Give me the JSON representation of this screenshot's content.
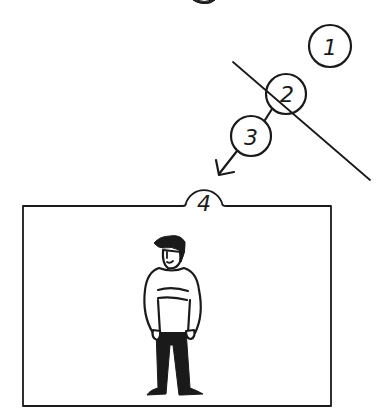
{
  "diagram": {
    "title_fragment": "g",
    "steps": [
      {
        "id": 1,
        "label": "1"
      },
      {
        "id": 2,
        "label": "2"
      },
      {
        "id": 3,
        "label": "3"
      },
      {
        "id": 4,
        "label": "4"
      }
    ],
    "ink_color": "#1a1a1a",
    "background": "#ffffff",
    "figure": {
      "description": "standing person in striped sweater and dark trousers",
      "sweater_color": "#ffffff",
      "trousers_color": "#111111"
    }
  }
}
